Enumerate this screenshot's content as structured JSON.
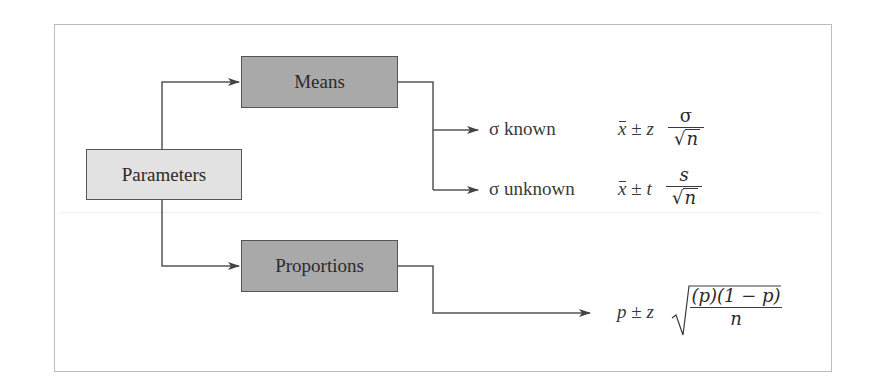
{
  "diagram": {
    "title": "",
    "nodes": {
      "root": {
        "label": "Parameters"
      },
      "means": {
        "label": "Means"
      },
      "proportions": {
        "label": "Proportions"
      }
    },
    "branches": {
      "sigma_known": {
        "label": "σ known",
        "formula": {
          "estimator": "x",
          "pm": "±",
          "critical": "z",
          "numerator": "σ",
          "denominator_root": "√",
          "denominator_var": "n"
        }
      },
      "sigma_unknown": {
        "label": "σ unknown",
        "formula": {
          "estimator": "x",
          "pm": "±",
          "critical": "t",
          "numerator": "s",
          "denominator_root": "√",
          "denominator_var": "n"
        }
      },
      "proportion": {
        "formula": {
          "estimator": "p",
          "pm": "±",
          "critical": "z",
          "numerator": "(p)(1 − p)",
          "denominator": "n"
        }
      }
    },
    "edges": [
      {
        "from": "Parameters",
        "to": "Means"
      },
      {
        "from": "Parameters",
        "to": "Proportions"
      },
      {
        "from": "Means",
        "to": "σ known"
      },
      {
        "from": "Means",
        "to": "σ unknown"
      },
      {
        "from": "Proportions",
        "to": "p ± z √((p)(1 − p)/n)"
      }
    ],
    "colors": {
      "root_fill": "#e2e2e2",
      "child_fill": "#a9a9a9",
      "line": "#555555",
      "frame": "#bdbdbd"
    }
  }
}
